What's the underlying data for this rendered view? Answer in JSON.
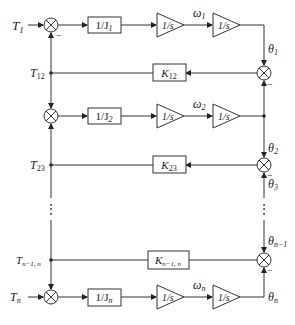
{
  "diagram": {
    "type": "block-diagram",
    "rows": [
      {
        "input": "T",
        "input_sub": "1",
        "gain": "1/J",
        "gain_sub": "1",
        "int1": "1/s",
        "omega": "ω",
        "omega_sub": "1",
        "int2": "1/s",
        "theta": "θ",
        "theta_sub": "1"
      },
      {
        "input": "",
        "gain": "1/J",
        "gain_sub": "2",
        "int1": "1/s",
        "omega": "ω",
        "omega_sub": "2",
        "int2": "1/s",
        "theta": "θ",
        "theta_sub": "2"
      },
      {
        "input": "T",
        "input_sub": "n",
        "gain": "1/J",
        "gain_sub": "n",
        "int1": "1/s",
        "omega": "ω",
        "omega_sub": "n",
        "int2": "1/s",
        "theta": "θ",
        "theta_sub": "n"
      }
    ],
    "couplings": [
      {
        "torque": "T",
        "torque_sub": "12",
        "gain": "K",
        "gain_sub": "12"
      },
      {
        "torque": "T",
        "torque_sub": "23",
        "gain": "K",
        "gain_sub": "23",
        "theta_lower": "θ",
        "theta_lower_sub": "3"
      },
      {
        "torque": "T",
        "torque_sub": "n−1, n",
        "gain": "K",
        "gain_sub": "n−1, n",
        "theta_upper": "θ",
        "theta_upper_sub": "n−1"
      }
    ],
    "minus_sign": "−",
    "ellipsis": "⋮"
  }
}
